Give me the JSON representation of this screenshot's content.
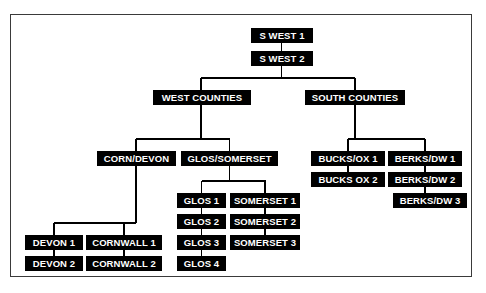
{
  "diagram": {
    "type": "org-chart",
    "node_fill": "#000000",
    "node_text_color": "#ffffff",
    "connector_color": "#000000",
    "frame_color": "#3a3a3a",
    "background": "#ffffff",
    "nodes": [
      {
        "id": "swest1",
        "label": "S WEST 1",
        "x": 251,
        "y": 28,
        "w": 62,
        "level": 0
      },
      {
        "id": "swest2",
        "label": "S WEST 2",
        "x": 251,
        "y": 51,
        "w": 62,
        "level": 0
      },
      {
        "id": "westco",
        "label": "WEST COUNTIES",
        "x": 153,
        "y": 90,
        "w": 98,
        "level": 1
      },
      {
        "id": "southco",
        "label": "SOUTH COUNTIES",
        "x": 305,
        "y": 90,
        "w": 100,
        "level": 1
      },
      {
        "id": "corndevon",
        "label": "CORN/DEVON",
        "x": 97,
        "y": 151,
        "w": 79,
        "level": 2
      },
      {
        "id": "glossom",
        "label": "GLOS/SOMERSET",
        "x": 181,
        "y": 151,
        "w": 97,
        "level": 2
      },
      {
        "id": "bucksox1",
        "label": "BUCKS/OX 1",
        "x": 311,
        "y": 151,
        "w": 74,
        "level": 2
      },
      {
        "id": "bucksox2",
        "label": "BUCKS OX 2",
        "x": 311,
        "y": 172,
        "w": 74,
        "level": 2
      },
      {
        "id": "berksdw1",
        "label": "BERKS/DW 1",
        "x": 388,
        "y": 151,
        "w": 74,
        "level": 2
      },
      {
        "id": "berksdw2",
        "label": "BERKS/DW 2",
        "x": 388,
        "y": 172,
        "w": 74,
        "level": 2
      },
      {
        "id": "berksdw3",
        "label": "BERKS/DW 3",
        "x": 393,
        "y": 193,
        "w": 74,
        "level": 2
      },
      {
        "id": "glos1",
        "label": "GLOS 1",
        "x": 177,
        "y": 193,
        "w": 49,
        "level": 3
      },
      {
        "id": "glos2",
        "label": "GLOS 2",
        "x": 177,
        "y": 214,
        "w": 49,
        "level": 3
      },
      {
        "id": "glos3",
        "label": "GLOS 3",
        "x": 177,
        "y": 235,
        "w": 49,
        "level": 3
      },
      {
        "id": "glos4",
        "label": "GLOS 4",
        "x": 177,
        "y": 256,
        "w": 49,
        "level": 3
      },
      {
        "id": "somerset1",
        "label": "SOMERSET 1",
        "x": 230,
        "y": 193,
        "w": 70,
        "level": 3
      },
      {
        "id": "somerset2",
        "label": "SOMERSET 2",
        "x": 230,
        "y": 214,
        "w": 70,
        "level": 3
      },
      {
        "id": "somerset3",
        "label": "SOMERSET 3",
        "x": 230,
        "y": 235,
        "w": 70,
        "level": 3
      },
      {
        "id": "devon1",
        "label": "DEVON 1",
        "x": 25,
        "y": 235,
        "w": 58,
        "level": 3
      },
      {
        "id": "devon2",
        "label": "DEVON 2",
        "x": 25,
        "y": 256,
        "w": 58,
        "level": 3
      },
      {
        "id": "cornwall1",
        "label": "CORNWALL 1",
        "x": 86,
        "y": 235,
        "w": 76,
        "level": 3
      },
      {
        "id": "cornwall2",
        "label": "CORNWALL 2",
        "x": 86,
        "y": 256,
        "w": 76,
        "level": 3
      }
    ],
    "connectors": [
      {
        "id": "swest1-swest2",
        "o": "v",
        "x": 281.5,
        "y": 43,
        "len": 8
      },
      {
        "id": "swest2-bus",
        "o": "v",
        "x": 281.5,
        "y": 66,
        "len": 12
      },
      {
        "id": "level1-bus",
        "o": "h",
        "x": 201,
        "y": 78,
        "len": 154
      },
      {
        "id": "bus-westco",
        "o": "v",
        "x": 201,
        "y": 78,
        "len": 12
      },
      {
        "id": "bus-southco",
        "o": "v",
        "x": 355,
        "y": 78,
        "len": 12
      },
      {
        "id": "westco-drop",
        "o": "v",
        "x": 201,
        "y": 105,
        "len": 34
      },
      {
        "id": "westco-bus",
        "o": "h",
        "x": 136,
        "y": 139,
        "len": 94
      },
      {
        "id": "bus-corndevon",
        "o": "v",
        "x": 136,
        "y": 139,
        "len": 12
      },
      {
        "id": "bus-glossom",
        "o": "v",
        "x": 229.5,
        "y": 139,
        "len": 12
      },
      {
        "id": "southco-drop",
        "o": "v",
        "x": 355,
        "y": 105,
        "len": 34
      },
      {
        "id": "southco-bus",
        "o": "h",
        "x": 348,
        "y": 139,
        "len": 77
      },
      {
        "id": "bus-bucksox1",
        "o": "v",
        "x": 348,
        "y": 139,
        "len": 12
      },
      {
        "id": "bus-berksdw1",
        "o": "v",
        "x": 425,
        "y": 139,
        "len": 12
      },
      {
        "id": "bucks1-bucks2",
        "o": "v",
        "x": 348,
        "y": 166,
        "len": 6
      },
      {
        "id": "berks1-berks2",
        "o": "v",
        "x": 425,
        "y": 166,
        "len": 6
      },
      {
        "id": "berks2-berks3",
        "o": "v",
        "x": 425,
        "y": 187,
        "len": 6
      },
      {
        "id": "corndevon-drop",
        "o": "v",
        "x": 136,
        "y": 166,
        "len": 57
      },
      {
        "id": "corndevon-bus",
        "o": "h",
        "x": 54,
        "y": 223,
        "len": 82
      },
      {
        "id": "bus-devon1",
        "o": "v",
        "x": 54,
        "y": 223,
        "len": 12
      },
      {
        "id": "bus-cornwall1",
        "o": "v",
        "x": 124,
        "y": 223,
        "len": 12
      },
      {
        "id": "devon1-devon2",
        "o": "v",
        "x": 54,
        "y": 250,
        "len": 6
      },
      {
        "id": "corn1-corn2",
        "o": "v",
        "x": 124,
        "y": 250,
        "len": 6
      },
      {
        "id": "glossom-drop",
        "o": "v",
        "x": 229.5,
        "y": 166,
        "len": 15
      },
      {
        "id": "glossom-bus",
        "o": "h",
        "x": 201.5,
        "y": 181,
        "len": 64
      },
      {
        "id": "bus-glos1",
        "o": "v",
        "x": 201.5,
        "y": 181,
        "len": 12
      },
      {
        "id": "bus-somerset1",
        "o": "v",
        "x": 265,
        "y": 181,
        "len": 12
      },
      {
        "id": "glos1-glos2",
        "o": "v",
        "x": 201.5,
        "y": 208,
        "len": 6
      },
      {
        "id": "glos2-glos3",
        "o": "v",
        "x": 201.5,
        "y": 229,
        "len": 6
      },
      {
        "id": "glos3-glos4",
        "o": "v",
        "x": 201.5,
        "y": 250,
        "len": 6
      },
      {
        "id": "som1-som2",
        "o": "v",
        "x": 265,
        "y": 208,
        "len": 6
      },
      {
        "id": "som2-som3",
        "o": "v",
        "x": 265,
        "y": 229,
        "len": 6
      }
    ]
  }
}
